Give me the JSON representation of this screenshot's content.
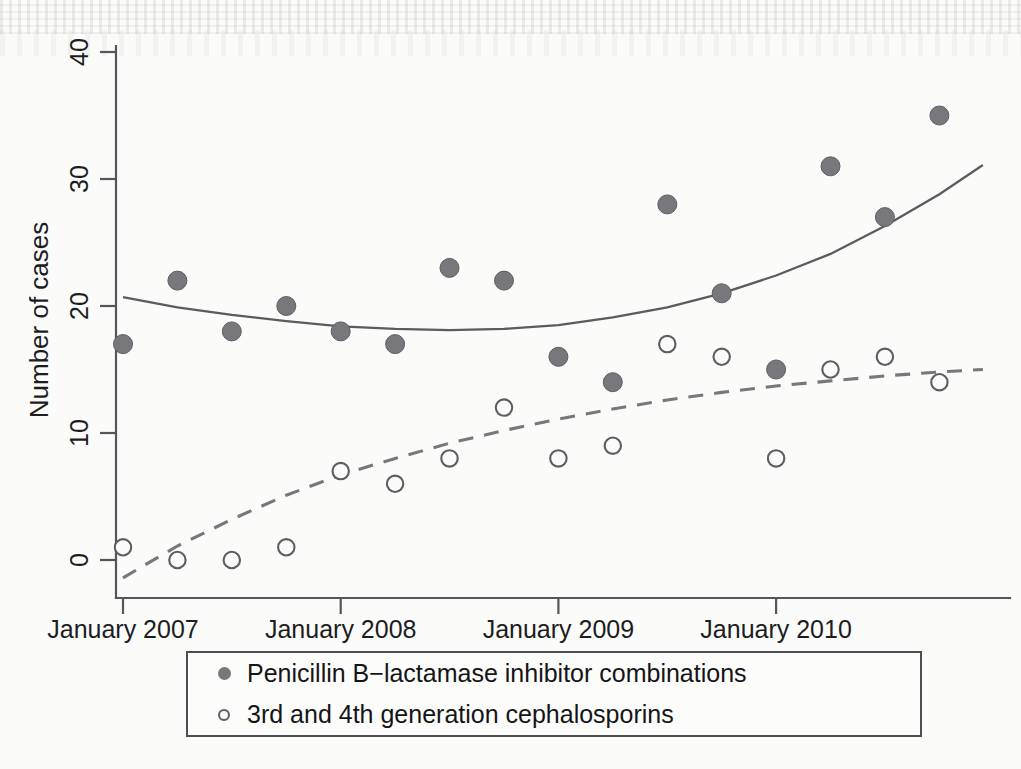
{
  "chart_data": {
    "type": "scatter",
    "title": "",
    "xlabel": "",
    "ylabel": "Number of cases",
    "xlim": [
      2006.75,
      2011.0
    ],
    "ylim": [
      -2,
      42
    ],
    "grid": false,
    "legend_position": "below-plot",
    "y_ticks": [
      "0",
      "10",
      "20",
      "30",
      "40"
    ],
    "y_tick_values": [
      0,
      10,
      20,
      30,
      40
    ],
    "x_ticks": [
      "January 2007",
      "January 2008",
      "January 2009",
      "January 2010"
    ],
    "x_tick_values": [
      2007.0,
      2008.0,
      2009.0,
      2010.0
    ],
    "series": [
      {
        "name": "Penicillin B−lactamase inhibitor combinations",
        "marker": "filled-circle",
        "color": "#77777c",
        "x": [
          2007.0,
          2007.25,
          2007.5,
          2007.75,
          2008.0,
          2008.25,
          2008.5,
          2008.75,
          2009.0,
          2009.25,
          2009.5,
          2009.75,
          2010.0,
          2010.25,
          2010.5,
          2010.75
        ],
        "values": [
          17,
          22,
          18,
          20,
          18,
          17,
          23,
          22,
          16,
          14,
          28,
          21,
          15,
          31,
          27,
          35
        ],
        "fit": {
          "style": "solid",
          "color": "#5b5b60",
          "points": [
            [
              2007.0,
              20.7
            ],
            [
              2007.25,
              19.9
            ],
            [
              2007.5,
              19.3
            ],
            [
              2007.75,
              18.8
            ],
            [
              2008.0,
              18.4
            ],
            [
              2008.25,
              18.2
            ],
            [
              2008.5,
              18.1
            ],
            [
              2008.75,
              18.2
            ],
            [
              2009.0,
              18.5
            ],
            [
              2009.25,
              19.1
            ],
            [
              2009.5,
              19.9
            ],
            [
              2009.75,
              21.0
            ],
            [
              2010.0,
              22.4
            ],
            [
              2010.25,
              24.1
            ],
            [
              2010.5,
              26.3
            ],
            [
              2010.75,
              28.8
            ],
            [
              2010.95,
              31.1
            ]
          ]
        }
      },
      {
        "name": "3rd and 4th generation cephalosporins",
        "marker": "open-circle",
        "color": "#5d5d62",
        "x": [
          2007.0,
          2007.25,
          2007.5,
          2007.75,
          2008.0,
          2008.25,
          2008.5,
          2008.75,
          2009.0,
          2009.25,
          2009.5,
          2009.75,
          2010.0,
          2010.25,
          2010.5,
          2010.75
        ],
        "values": [
          1,
          0,
          0,
          1,
          7,
          6,
          8,
          12,
          8,
          9,
          17,
          16,
          8,
          15,
          16,
          14
        ],
        "fit": {
          "style": "dashed",
          "color": "#77777c",
          "points": [
            [
              2007.0,
              -1.4
            ],
            [
              2007.25,
              1.1
            ],
            [
              2007.5,
              3.2
            ],
            [
              2007.75,
              5.1
            ],
            [
              2008.0,
              6.7
            ],
            [
              2008.25,
              8.0
            ],
            [
              2008.5,
              9.2
            ],
            [
              2008.75,
              10.2
            ],
            [
              2009.0,
              11.1
            ],
            [
              2009.25,
              11.9
            ],
            [
              2009.5,
              12.6
            ],
            [
              2009.75,
              13.2
            ],
            [
              2010.0,
              13.7
            ],
            [
              2010.25,
              14.1
            ],
            [
              2010.5,
              14.5
            ],
            [
              2010.75,
              14.8
            ],
            [
              2010.95,
              15.0
            ]
          ]
        }
      }
    ]
  },
  "legend": {
    "items": [
      {
        "marker": "filled-circle",
        "label": "Penicillin B−lactamase inhibitor combinations"
      },
      {
        "marker": "open-circle",
        "label": "3rd and 4th generation cephalosporins"
      }
    ]
  }
}
